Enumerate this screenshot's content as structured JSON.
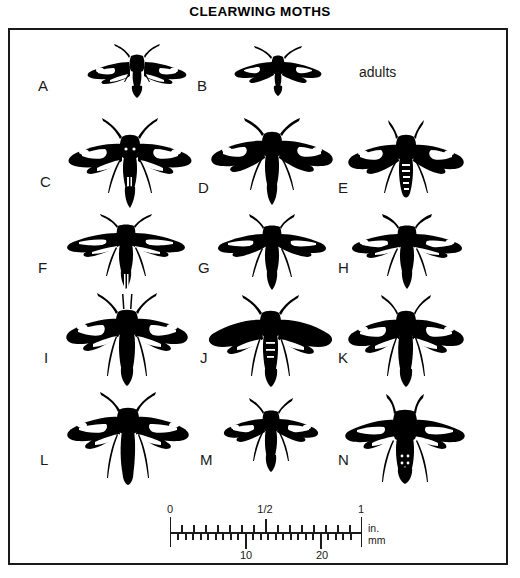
{
  "plate": {
    "title": "CLEARWING MOTHS",
    "caption": "adults",
    "border_color": "#1a1a1a",
    "ink_color": "#000000",
    "background_color": "#ffffff"
  },
  "figures": [
    {
      "label": "A",
      "row": 1,
      "column": "left",
      "size": "small",
      "label_x": 36,
      "label_y": 76,
      "moth_x": 80,
      "moth_y": 40,
      "moth_w": 110,
      "moth_h": 62
    },
    {
      "label": "B",
      "row": 1,
      "column": "middle",
      "size": "small",
      "label_x": 195,
      "label_y": 76,
      "moth_x": 228,
      "moth_y": 42,
      "moth_w": 96,
      "moth_h": 54
    },
    {
      "label": "C",
      "row": 2,
      "column": "left",
      "size": "large",
      "label_x": 38,
      "label_y": 172,
      "moth_x": 62,
      "moth_y": 115,
      "moth_w": 132,
      "moth_h": 90
    },
    {
      "label": "D",
      "row": 2,
      "column": "middle",
      "size": "large",
      "label_x": 196,
      "label_y": 178,
      "moth_x": 205,
      "moth_y": 114,
      "moth_w": 130,
      "moth_h": 88
    },
    {
      "label": "E",
      "row": 2,
      "column": "right",
      "size": "large",
      "label_x": 336,
      "label_y": 178,
      "moth_x": 340,
      "moth_y": 118,
      "moth_w": 128,
      "moth_h": 86
    },
    {
      "label": "F",
      "row": 3,
      "column": "left",
      "size": "medium",
      "label_x": 36,
      "label_y": 258,
      "moth_x": 60,
      "moth_y": 210,
      "moth_w": 128,
      "moth_h": 78
    },
    {
      "label": "G",
      "row": 3,
      "column": "middle",
      "size": "medium",
      "label_x": 196,
      "label_y": 258,
      "moth_x": 210,
      "moth_y": 212,
      "moth_w": 120,
      "moth_h": 76
    },
    {
      "label": "H",
      "row": 3,
      "column": "right",
      "size": "medium",
      "label_x": 336,
      "label_y": 258,
      "moth_x": 345,
      "moth_y": 212,
      "moth_w": 120,
      "moth_h": 76
    },
    {
      "label": "I",
      "row": 4,
      "column": "left",
      "size": "large",
      "label_x": 42,
      "label_y": 348,
      "moth_x": 58,
      "moth_y": 290,
      "moth_w": 134,
      "moth_h": 94
    },
    {
      "label": "J",
      "row": 4,
      "column": "middle",
      "size": "large",
      "label_x": 198,
      "label_y": 348,
      "moth_x": 203,
      "moth_y": 292,
      "moth_w": 130,
      "moth_h": 92
    },
    {
      "label": "K",
      "row": 4,
      "column": "right",
      "size": "large",
      "label_x": 336,
      "label_y": 348,
      "moth_x": 340,
      "moth_y": 292,
      "moth_w": 128,
      "moth_h": 92
    },
    {
      "label": "L",
      "row": 5,
      "column": "left",
      "size": "large",
      "label_x": 38,
      "label_y": 450,
      "moth_x": 58,
      "moth_y": 390,
      "moth_w": 136,
      "moth_h": 92
    },
    {
      "label": "M",
      "row": 5,
      "column": "middle",
      "size": "small",
      "label_x": 198,
      "label_y": 450,
      "moth_x": 218,
      "moth_y": 396,
      "moth_w": 102,
      "moth_h": 72
    },
    {
      "label": "N",
      "row": 5,
      "column": "right",
      "size": "large",
      "label_x": 336,
      "label_y": 450,
      "moth_x": 336,
      "moth_y": 392,
      "moth_w": 132,
      "moth_h": 90
    }
  ],
  "scale": {
    "inch_labels": [
      "0",
      "1/2",
      "1"
    ],
    "mm_labels": [
      "10",
      "20"
    ],
    "unit_top": "in.",
    "unit_bottom": "mm",
    "inch_range": [
      0,
      1
    ],
    "mm_range": [
      0,
      25
    ],
    "inch_minor_divisions": 16,
    "mm_minor_divisions": 25,
    "bar_length_px": 190
  }
}
